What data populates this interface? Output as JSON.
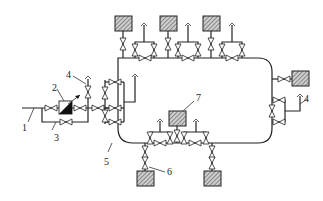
{
  "diagram": {
    "type": "pipeline-schematic",
    "labels": {
      "l1": "1",
      "l2": "2",
      "l3": "3",
      "l4a": "4",
      "l4b": "4",
      "l5": "5",
      "l6": "6",
      "l7": "7"
    },
    "components": [
      {
        "id": "1",
        "name": "inlet pipe"
      },
      {
        "id": "2",
        "name": "pressure regulator"
      },
      {
        "id": "3",
        "name": "bypass line"
      },
      {
        "id": "4",
        "name": "vent stack"
      },
      {
        "id": "5",
        "name": "ring main pipe"
      },
      {
        "id": "6",
        "name": "consumer unit (bottom)"
      },
      {
        "id": "7",
        "name": "consumer unit (inner)"
      }
    ],
    "colors": {
      "line": "#222222",
      "background": "#ffffff",
      "hatch": "#555555"
    }
  }
}
